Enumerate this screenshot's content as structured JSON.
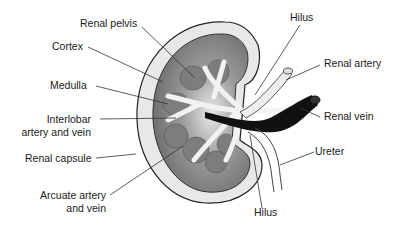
{
  "labels": {
    "renal_pelvis": "Renal pelvis",
    "cortex": "Cortex",
    "medulla": "Medulla",
    "interlobar_line1": "Interlobar",
    "interlobar_line2": "artery and vein",
    "renal_capsule": "Renal capsule",
    "arcuate_line1": "Arcuate artery",
    "arcuate_line2": "and vein",
    "hilus_top": "Hilus",
    "renal_artery": "Renal artery",
    "renal_vein": "Renal vein",
    "ureter": "Ureter",
    "hilus_bottom": "Hilus"
  },
  "colors": {
    "capsule": "#e6e6e6",
    "cortex_outer": "#bdbdbd",
    "cortex_inner": "#7a7a7a",
    "pyramid": "#808080",
    "vein": "#111111",
    "line": "#333333"
  }
}
